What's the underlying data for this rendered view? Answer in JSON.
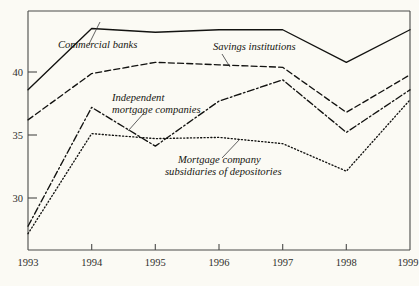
{
  "chart_data": {
    "type": "line",
    "title": "",
    "xlabel": "",
    "ylabel": "",
    "categories": [
      "1993",
      "1994",
      "1995",
      "1996",
      "1997",
      "1998",
      "1999"
    ],
    "x": [
      1993,
      1994,
      1995,
      1996,
      1997,
      1998,
      1999
    ],
    "xlim": [
      1993,
      1999
    ],
    "ylim": [
      25.9,
      45.0
    ],
    "yticks": [
      30,
      35,
      40
    ],
    "ytick_labels": [
      "30",
      "35",
      "40"
    ],
    "xtick_labels": [
      "1993",
      "1994",
      "1995",
      "1996",
      "1997",
      "1998",
      "1999"
    ],
    "grid": false,
    "legend": "inline-annotations",
    "series": [
      {
        "name": "Commercial banks",
        "style": "solid",
        "values": [
          38.7,
          43.6,
          43.3,
          43.5,
          43.5,
          40.9,
          43.5
        ]
      },
      {
        "name": "Savings institutions",
        "style": "dashed",
        "values": [
          36.3,
          40.0,
          40.9,
          40.7,
          40.5,
          36.9,
          39.9
        ]
      },
      {
        "name": "Independent mortgage companies",
        "style": "dash-dot",
        "values": [
          27.8,
          37.3,
          34.2,
          37.8,
          39.5,
          35.3,
          38.7
        ]
      },
      {
        "name": "Mortgage company subsidiaries of depositories",
        "style": "dotted",
        "values": [
          27.2,
          35.2,
          34.8,
          34.9,
          34.4,
          32.2,
          37.9
        ]
      }
    ],
    "annotations": [
      {
        "id": "commercial-banks",
        "text": "Commercial banks",
        "line1": "Commercial banks",
        "line2": ""
      },
      {
        "id": "savings-institutions",
        "text": "Savings institutions",
        "line1": "Savings institutions",
        "line2": ""
      },
      {
        "id": "independent-mortgage-companies",
        "text": "Independent mortgage companies",
        "line1": "Independent",
        "line2": "mortgage companies"
      },
      {
        "id": "mortgage-company-subsidiaries",
        "text": "Mortgage company subsidiaries of depositories",
        "line1": "Mortgage company",
        "line2": "subsidiaries of depositories"
      }
    ],
    "colors": {
      "line": "#121210",
      "axis": "#4a4a48",
      "background": "#fbfaf4",
      "text": "#15150f"
    }
  },
  "footnote": {
    "text": ""
  }
}
